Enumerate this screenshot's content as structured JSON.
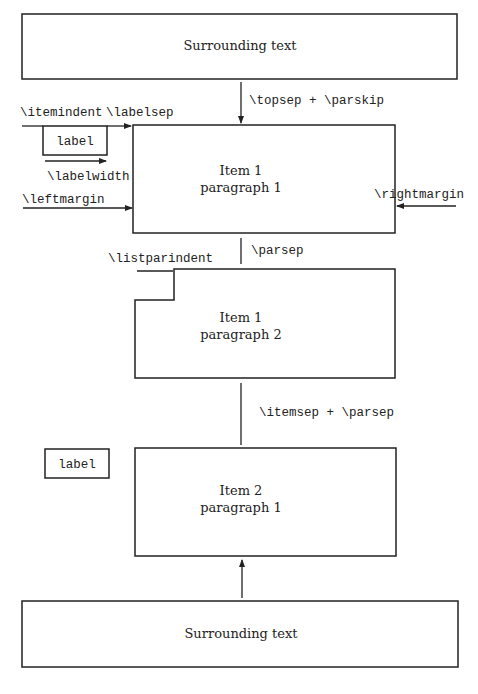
{
  "diagram": {
    "boxes": {
      "surrounding_top": {
        "text": "Surrounding text"
      },
      "item1_par1": {
        "line1": "Item 1",
        "line2": "paragraph 1"
      },
      "item1_par2": {
        "line1": "Item 1",
        "line2": "paragraph 2"
      },
      "item2_par1": {
        "line1": "Item 2",
        "line2": "paragraph 1"
      },
      "surrounding_bottom": {
        "text": "Surrounding text"
      }
    },
    "labels": {
      "label_item1": "label",
      "label_item2": "label"
    },
    "dimensions": {
      "topsep_parskip": "\\topsep + \\parskip",
      "itemindent": "\\itemindent",
      "labelsep": "\\labelsep",
      "labelwidth": "\\labelwidth",
      "leftmargin": "\\leftmargin",
      "rightmargin": "\\rightmargin",
      "parsep": "\\parsep",
      "listparindent": "\\listparindent",
      "itemsep_parsep": "\\itemsep + \\parsep"
    },
    "colors": {
      "stroke": "#222222",
      "background": "#ffffff"
    }
  }
}
